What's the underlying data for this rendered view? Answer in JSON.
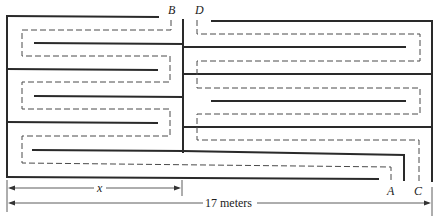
{
  "diagram": {
    "type": "maze-floor-plan",
    "labels": {
      "point_a": "A",
      "point_b": "B",
      "point_c": "C",
      "point_d": "D"
    },
    "dimensions": {
      "partial_width_label": "x",
      "total_width_label": "17 meters"
    },
    "colors": {
      "wall": "#2a2a2a",
      "path": "#4a4a4a",
      "background": "#ffffff"
    }
  }
}
